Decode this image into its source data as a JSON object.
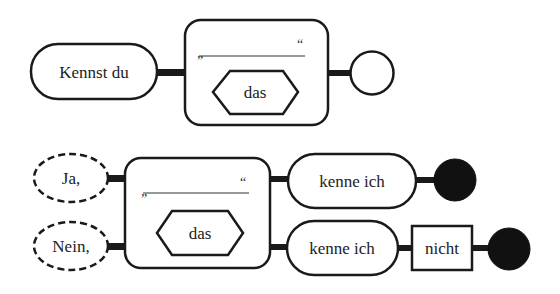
{
  "colors": {
    "stroke": "#1a1a1a",
    "fill": "#ffffff",
    "end_filled": "#111111",
    "text": "#222222"
  },
  "row1": {
    "start": {
      "shape": "pill",
      "label": "Kennst du"
    },
    "block": {
      "quote_open": "„",
      "quote_close": "“",
      "blank_line": true,
      "hexagon_label": "das"
    },
    "end": {
      "shape": "circle-empty"
    }
  },
  "row2": {
    "starts": [
      {
        "shape": "ellipse-dashed",
        "label": "Ja,"
      },
      {
        "shape": "ellipse-dashed",
        "label": "Nein,"
      }
    ],
    "block": {
      "quote_open": "„",
      "quote_close": "“",
      "blank_line": true,
      "hexagon_label": "das"
    },
    "branch_yes": {
      "pill_label": "kenne ich",
      "end": {
        "shape": "circle-filled"
      }
    },
    "branch_no": {
      "pill_label": "kenne ich",
      "box_label": "nicht",
      "end": {
        "shape": "circle-filled"
      }
    }
  }
}
